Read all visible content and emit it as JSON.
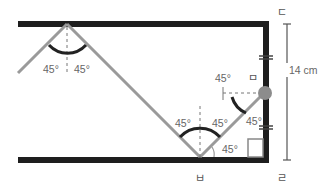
{
  "diagram": {
    "type": "billiard-reflection",
    "points": {
      "top_right": "ㄷ",
      "ball": "ㅁ",
      "bottom_reflect": "ㅂ",
      "bottom_right": "ㄹ"
    },
    "measurement": {
      "label": "14 cm",
      "segment": "ㄷ-ㄹ"
    },
    "angles": {
      "top_left": "45°",
      "top_right": "45°",
      "bottom_left": "45°",
      "bottom_right": "45°",
      "ball_angle": "45°",
      "wall_angle": "45°",
      "corner_angle": "45°"
    },
    "colors": {
      "wall": "#1e1e1e",
      "path": "#9a9a9a",
      "ball": "#8c8c8c",
      "arc": "#222222",
      "text": "#666666"
    }
  }
}
